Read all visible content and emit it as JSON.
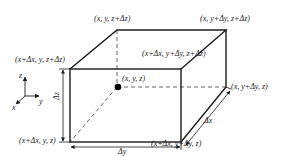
{
  "diagram": {
    "colors": {
      "edge": "#1a1a1a",
      "hidden_edge": "#555555",
      "text": "#222222",
      "point": "#000000"
    },
    "vertex_labels": {
      "back_top_left": "(x,  y,  z+Δz)",
      "back_top_right": "(x,  y+Δy,  z+Δz)",
      "front_top_left": "(x+Δx,  y,  z+Δz)",
      "front_top_right": "(x+Δx,  y+Δy,  z+Δz)",
      "center_point": "(x,  y,  z)",
      "back_bottom_right": "(x,  y+Δy,  z)",
      "front_bottom_left": "(x+Δx,  y,  z)",
      "front_bottom_right": "(x+Δx,  y+Δy,  z)"
    },
    "dimension_labels": {
      "dz": "Δz",
      "dy": "Δy",
      "dx": "Δx"
    },
    "axes": {
      "z": "z",
      "y": "y",
      "x": "x"
    }
  }
}
